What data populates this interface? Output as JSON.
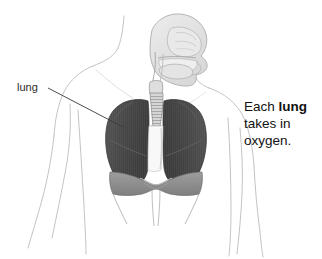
{
  "figure": {
    "background_color": "#ffffff",
    "width": 322,
    "height": 259
  },
  "annotation": {
    "label": "lung",
    "leader_line": {
      "from_x": 48,
      "from_y": 88,
      "to_x": 123,
      "to_y": 127,
      "color": "#3a3a3a"
    }
  },
  "caption": {
    "line1_pre": "Each ",
    "line1_bold": "lung",
    "line2": "takes in",
    "line3": "oxygen.",
    "color": "#111111"
  },
  "anatomy": {
    "body_outline_color": "#b9b9b9",
    "head_fill_color": "#e2e2e2",
    "head_outline_color": "#a8a8a8",
    "trachea_fill_color": "#d2d2d2",
    "trachea_outline_color": "#8f8f8f",
    "lung_fill_color": "#4a4a4a",
    "lung_shadow_color": "#3a3a3a",
    "lung_highlight_color": "#5e5e5e",
    "mediastinum_fill_color": "#f7f7f7",
    "diaphragm_fill_color": "#8a8a8a",
    "diaphragm_light_color": "#9c9c9c",
    "parts": [
      "nasal-cavity",
      "oral-cavity",
      "tongue",
      "pharynx",
      "larynx",
      "trachea",
      "left-lung",
      "right-lung",
      "heart-mediastinum",
      "diaphragm",
      "torso",
      "arms"
    ]
  }
}
